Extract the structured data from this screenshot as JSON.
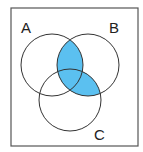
{
  "diagram": {
    "type": "venn",
    "sets": [
      {
        "label": "A",
        "cx": 52,
        "cy": 65,
        "r": 31
      },
      {
        "label": "B",
        "cx": 88,
        "cy": 65,
        "r": 31
      },
      {
        "label": "C",
        "cx": 70,
        "cy": 100,
        "r": 31
      }
    ],
    "shaded_region": "B ∩ (A ∪ C)",
    "shade_color": "#5bc0f0",
    "stroke_color": "#333333",
    "frame": {
      "x": 11,
      "y": 8,
      "width": 127,
      "height": 138,
      "stroke": "#555555"
    },
    "labels": {
      "a": "A",
      "b": "B",
      "c": "C"
    }
  }
}
